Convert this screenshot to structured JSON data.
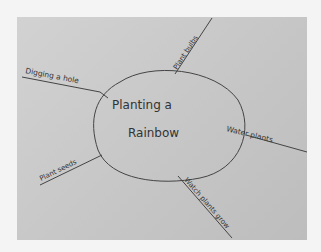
{
  "mind_map": {
    "center": {
      "line1": "Planting a",
      "line2": "Rainbow"
    },
    "branches": [
      {
        "label": "Plant bulbs",
        "position": "top"
      },
      {
        "label": "Digging a hole",
        "position": "left-top"
      },
      {
        "label": "Water plants",
        "position": "right"
      },
      {
        "label": "Plant seeds",
        "position": "left-bottom"
      },
      {
        "label": "Watch plants grow",
        "position": "bottom-right"
      }
    ]
  },
  "colors": {
    "paper": "#c8c8c8",
    "ink": "#333333",
    "background": "#f4f4f4"
  }
}
